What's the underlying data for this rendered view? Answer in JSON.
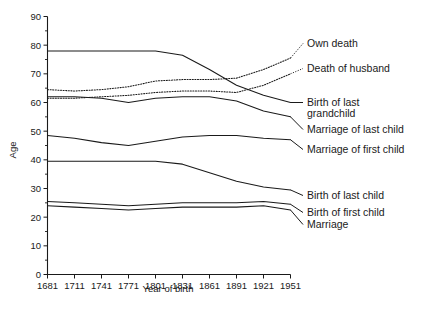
{
  "chart_data": {
    "type": "line",
    "title": "",
    "xlabel": "Year of birth",
    "ylabel": "Age",
    "xlim": [
      1681,
      1951
    ],
    "ylim": [
      0,
      90
    ],
    "xticks": [
      "1681",
      "1711",
      "1741",
      "1771",
      "1801",
      "1831",
      "1861",
      "1891",
      "1921",
      "1951"
    ],
    "yticks": [
      "0",
      "10",
      "20",
      "30",
      "40",
      "50",
      "60",
      "70",
      "80",
      "90"
    ],
    "y_minor_step": 5,
    "grid": false,
    "legend": "right-inline-labels",
    "x": [
      1681,
      1711,
      1741,
      1771,
      1801,
      1831,
      1861,
      1891,
      1921,
      1951
    ],
    "series": [
      {
        "name": "Own death",
        "label": "Own death",
        "style": "dotted",
        "values": [
          64.5,
          64.0,
          64.5,
          65.5,
          67.5,
          68.0,
          68.0,
          68.5,
          71.5,
          75.5
        ]
      },
      {
        "name": "Death of husband",
        "label": "Death of husband",
        "style": "dotted",
        "values": [
          61.5,
          61.5,
          62.0,
          62.5,
          63.5,
          64.0,
          64.0,
          63.5,
          66.0,
          70.0
        ]
      },
      {
        "name": "Birth of last grandchild",
        "label_line1": "Birth of last",
        "label_line2": "grandchild",
        "style": "solid",
        "values": [
          78.0,
          78.0,
          78.0,
          78.0,
          78.0,
          76.5,
          71.5,
          66.0,
          62.5,
          60.0
        ]
      },
      {
        "name": "Marriage of last child",
        "label": "Marriage of last child",
        "style": "solid",
        "values": [
          62.0,
          62.0,
          61.5,
          60.0,
          61.5,
          62.0,
          62.0,
          60.5,
          57.0,
          55.0
        ]
      },
      {
        "name": "Marriage of first child",
        "label": "Marriage of first child",
        "style": "solid",
        "values": [
          48.5,
          47.5,
          46.0,
          45.0,
          46.5,
          48.0,
          48.5,
          48.5,
          47.5,
          47.0
        ]
      },
      {
        "name": "Birth of last child",
        "label": "Birth of last child",
        "style": "solid",
        "values": [
          39.5,
          39.5,
          39.5,
          39.5,
          39.5,
          38.5,
          35.5,
          32.5,
          30.5,
          29.5
        ]
      },
      {
        "name": "Birth of first child",
        "label": "Birth of first child",
        "style": "solid",
        "values": [
          25.5,
          25.0,
          24.5,
          24.0,
          24.5,
          25.0,
          25.0,
          25.0,
          25.5,
          24.5
        ]
      },
      {
        "name": "Marriage",
        "label": "Marriage",
        "style": "solid",
        "values": [
          24.0,
          23.5,
          23.0,
          22.5,
          23.0,
          23.5,
          23.5,
          23.5,
          24.0,
          22.5
        ]
      }
    ]
  }
}
